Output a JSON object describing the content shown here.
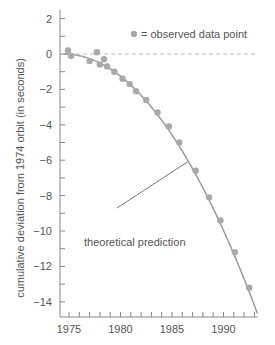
{
  "chart_data": {
    "type": "scatter",
    "title": "",
    "xlabel": "",
    "ylabel": "cumulative deviation from 1974 orbit (in seconds)",
    "xlim": [
      1974.0,
      1993.3
    ],
    "ylim": [
      -15,
      2.5
    ],
    "x_ticks": [
      1975,
      1980,
      1985,
      1990
    ],
    "x_minor_step": 1,
    "y_ticks": [
      2,
      0,
      -2,
      -4,
      -6,
      -8,
      -10,
      -12,
      -14
    ],
    "y_minor_step": 1,
    "grid": false,
    "legend": {
      "label": "= observed data point",
      "position": "top-right"
    },
    "reference_line": {
      "y": 0,
      "style": "dashed"
    },
    "series": [
      {
        "name": "observed data point",
        "kind": "scatter",
        "points": [
          [
            1974.9,
            0.2
          ],
          [
            1975.2,
            -0.1
          ],
          [
            1977.0,
            -0.4
          ],
          [
            1977.7,
            0.1
          ],
          [
            1978.0,
            -0.6
          ],
          [
            1978.4,
            -0.3
          ],
          [
            1978.7,
            -0.7
          ],
          [
            1979.4,
            -1.0
          ],
          [
            1980.2,
            -1.4
          ],
          [
            1980.9,
            -1.7
          ],
          [
            1981.5,
            -2.1
          ],
          [
            1982.5,
            -2.6
          ],
          [
            1983.6,
            -3.3
          ],
          [
            1984.7,
            -4.1
          ],
          [
            1985.7,
            -5.0
          ],
          [
            1987.3,
            -6.6
          ],
          [
            1988.6,
            -8.1
          ],
          [
            1989.7,
            -9.4
          ],
          [
            1991.1,
            -11.2
          ],
          [
            1992.5,
            -13.2
          ]
        ]
      },
      {
        "name": "theoretical prediction",
        "kind": "line",
        "formula": "y = -0.0415*(x-1974.5)^2 (approx. parabola)"
      }
    ],
    "annotations": [
      {
        "text": "theoretical prediction",
        "points_to": [
          1986.5,
          -6.1
        ]
      }
    ]
  },
  "colors": {
    "axis": "#888888",
    "point": "#a9a9a9",
    "curve": "#9a9a9a",
    "text": "#555555",
    "dashed": "#bbbbbb"
  }
}
